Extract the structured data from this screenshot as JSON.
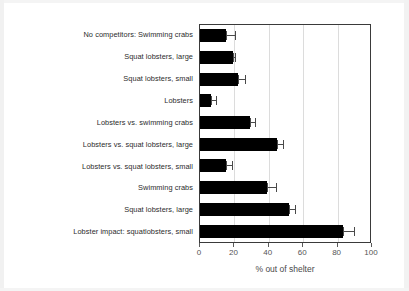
{
  "chart_data": {
    "type": "bar",
    "orientation": "horizontal",
    "title": "",
    "xlabel": "% out of shelter",
    "ylabel": "",
    "xlim": [
      0,
      100
    ],
    "xticks": [
      0,
      20,
      40,
      60,
      80,
      100
    ],
    "grid": "vertical gridlines at 20, 40, 60, 80",
    "legend": "none",
    "bar_color": "#000000",
    "error_bar_color": "#4a4a4a",
    "categories": [
      "No competitors: Swimming crabs",
      "Squat lobsters, large",
      "Squat lobsters, small",
      "Lobsters",
      "Lobsters vs. swimming crabs",
      "Lobsters  vs. squat lobsters, large",
      "Lobsters vs. squat lobsters, small",
      "Swimming crabs",
      "Squat lobsters, large",
      "Lobster impact: squatlobsters, small"
    ],
    "values": [
      15,
      19,
      22,
      6.5,
      29,
      45,
      15,
      39,
      52,
      83
    ],
    "error_upper": [
      21,
      21,
      27,
      10,
      32.5,
      49,
      19,
      45,
      56,
      90
    ],
    "error_lower": [
      15,
      19,
      22,
      6.5,
      29,
      45,
      15,
      39,
      52,
      83
    ]
  }
}
